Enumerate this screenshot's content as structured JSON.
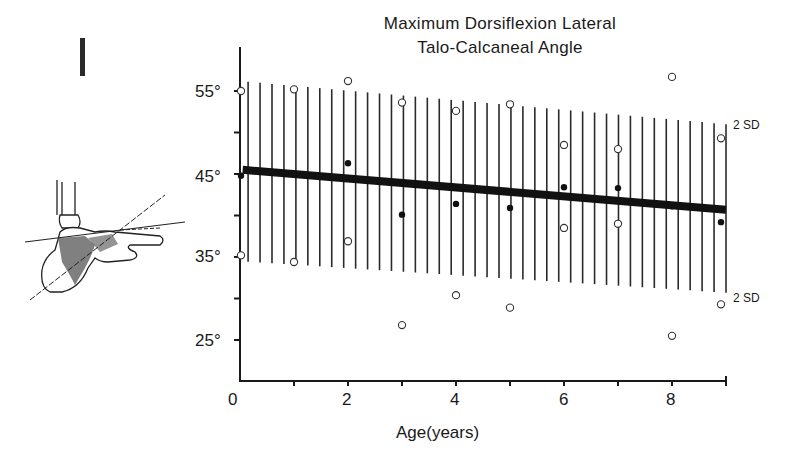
{
  "figure": {
    "panel_label": "I",
    "title_line1": "Maximum Dorsiflexion Lateral",
    "title_line2": "Talo-Calcaneal Angle"
  },
  "chart_data": {
    "type": "scatter",
    "title": "Maximum Dorsiflexion Lateral Talo-Calcaneal Angle",
    "xlabel": "Age(years)",
    "ylabel": "",
    "xlim": [
      0,
      9
    ],
    "ylim": [
      20,
      60
    ],
    "x_ticks": [
      0,
      2,
      4,
      6,
      8
    ],
    "x_minor_ticks": [
      1,
      3,
      5,
      7,
      9
    ],
    "y_ticks": [
      "25°",
      "35°",
      "45°",
      "55°"
    ],
    "y_tick_values": [
      25,
      35,
      45,
      55
    ],
    "y_minor_ticks": [
      30,
      40,
      50
    ],
    "grid": false,
    "series": [
      {
        "name": "Mean (filled)",
        "marker": "filled-circle",
        "x": [
          0,
          1,
          2,
          3,
          4,
          5,
          6,
          7,
          8,
          9
        ],
        "values": [
          44.8,
          45.0,
          46.3,
          40.1,
          41.4,
          40.9,
          43.4,
          43.3,
          41.1,
          39.2
        ]
      },
      {
        "name": "Mean + 2 SD (open)",
        "marker": "open-circle",
        "x": [
          0,
          1,
          2,
          3,
          4,
          5,
          6,
          7,
          8,
          9
        ],
        "values": [
          55.0,
          55.2,
          56.2,
          53.6,
          52.6,
          53.4,
          48.5,
          48.0,
          56.7,
          49.3
        ]
      },
      {
        "name": "Mean - 2 SD (open)",
        "marker": "open-circle",
        "x": [
          0,
          1,
          2,
          3,
          4,
          5,
          6,
          7,
          8,
          9
        ],
        "values": [
          35.2,
          34.4,
          36.9,
          26.8,
          30.4,
          28.9,
          38.5,
          39.0,
          25.5,
          29.3
        ]
      },
      {
        "name": "Regression line",
        "type": "line",
        "x": [
          0,
          9
        ],
        "values": [
          45.5,
          40.7
        ]
      },
      {
        "name": "Upper 2 SD band",
        "type": "line",
        "x": [
          0,
          9
        ],
        "values": [
          56.2,
          51.0
        ]
      },
      {
        "name": "Lower 2 SD band",
        "type": "line",
        "x": [
          0,
          9
        ],
        "values": [
          34.5,
          30.7
        ]
      }
    ],
    "annotations": [
      "2 SD",
      "2 SD"
    ],
    "band_style": "vertical hatching between ±2 SD"
  },
  "labels": {
    "upper_sd": "2 SD",
    "lower_sd": "2 SD",
    "x_axis_title": "Age(years)",
    "x_tick_0": "0",
    "x_tick_2": "2",
    "x_tick_4": "4",
    "x_tick_6": "6",
    "x_tick_8": "8",
    "y_tick_25": "25°",
    "y_tick_35": "35°",
    "y_tick_45": "45°",
    "y_tick_55": "55°"
  }
}
